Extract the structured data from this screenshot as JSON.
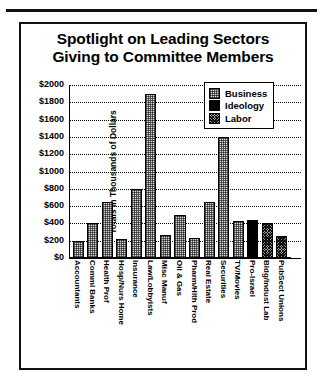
{
  "chart_data": {
    "type": "bar",
    "title": "Spotlight on Leading Sectors Giving to Committee Members",
    "title_lines": [
      "Spotlight on Leading Sectors",
      "Giving to Committee Members"
    ],
    "xlabel": "",
    "ylabel": "Totals in Thousands of Dollars",
    "ylim": [
      0,
      2000
    ],
    "ytick_step": 200,
    "yticks": [
      "$0",
      "$200",
      "$400",
      "$600",
      "$800",
      "$1000",
      "$1200",
      "$1400",
      "$1600",
      "$1800",
      "$2000"
    ],
    "ytick_values": [
      0,
      200,
      400,
      600,
      800,
      1000,
      1200,
      1400,
      1600,
      1800,
      2000
    ],
    "grid": true,
    "legend_position": "upper-right",
    "legend": [
      {
        "label": "Business",
        "pattern": "light-stipple",
        "color": "#d8d8d8"
      },
      {
        "label": "Ideology",
        "pattern": "solid-black",
        "color": "#000000"
      },
      {
        "label": "Labor",
        "pattern": "dark-crosshatch",
        "color": "#9a9a9a"
      }
    ],
    "categories": [
      "Accountants",
      "Comml Banks",
      "Health Prof",
      "Hosp/Nurs Home",
      "Insurance",
      "Law/Lobbyists",
      "Misc Manuf",
      "Oil & Gas",
      "Pharm/Hlth Prod",
      "Real Estate",
      "Securities",
      "TV/Movies",
      "Pro-Israel",
      "Bldg/Indust Lab",
      "PubSect Unions"
    ],
    "values": [
      200,
      400,
      650,
      220,
      800,
      1900,
      270,
      500,
      230,
      650,
      1400,
      430,
      440,
      400,
      250
    ],
    "groups": [
      "Business",
      "Business",
      "Business",
      "Business",
      "Business",
      "Business",
      "Business",
      "Business",
      "Business",
      "Business",
      "Business",
      "Business",
      "Ideology",
      "Labor",
      "Labor"
    ],
    "bars": [
      {
        "category": "Accountants",
        "value": 200,
        "group": "Business"
      },
      {
        "category": "Comml Banks",
        "value": 400,
        "group": "Business"
      },
      {
        "category": "Health Prof",
        "value": 650,
        "group": "Business"
      },
      {
        "category": "Hosp/Nurs Home",
        "value": 220,
        "group": "Business"
      },
      {
        "category": "Insurance",
        "value": 800,
        "group": "Business"
      },
      {
        "category": "Law/Lobbyists",
        "value": 1900,
        "group": "Business"
      },
      {
        "category": "Misc Manuf",
        "value": 270,
        "group": "Business"
      },
      {
        "category": "Oil & Gas",
        "value": 500,
        "group": "Business"
      },
      {
        "category": "Pharm/Hlth Prod",
        "value": 230,
        "group": "Business"
      },
      {
        "category": "Real Estate",
        "value": 650,
        "group": "Business"
      },
      {
        "category": "Securities",
        "value": 1400,
        "group": "Business"
      },
      {
        "category": "TV/Movies",
        "value": 430,
        "group": "Business"
      },
      {
        "category": "Pro-Israel",
        "value": 440,
        "group": "Ideology"
      },
      {
        "category": "Bldg/Indust Lab",
        "value": 400,
        "group": "Labor"
      },
      {
        "category": "PubSect Unions",
        "value": 250,
        "group": "Labor"
      }
    ]
  }
}
